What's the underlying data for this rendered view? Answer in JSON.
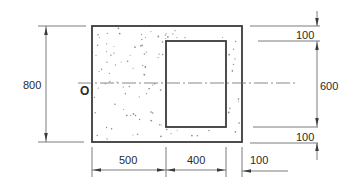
{
  "diagram": {
    "type": "engineering-section-drawing",
    "colors": {
      "line": "#3a3a3a",
      "fill_stipple": "#8a8a8a",
      "background": "#ffffff"
    },
    "origin_label": "O",
    "outer_rect": {
      "width_mm": 1000,
      "height_mm": 800
    },
    "inner_opening": {
      "width_mm": 400,
      "height_mm": 600,
      "offset_left_mm": 500,
      "offset_right_mm": 100,
      "offset_top_mm": 100,
      "offset_bottom_mm": 100
    },
    "dimensions": {
      "left_height": "800",
      "right_top": "100",
      "right_middle": "600",
      "right_bottom": "100",
      "bottom_left": "500",
      "bottom_middle": "400",
      "bottom_right": "100"
    }
  }
}
